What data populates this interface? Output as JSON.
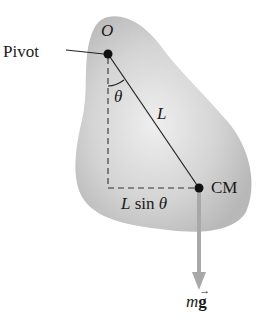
{
  "figure": {
    "labels": {
      "pivot": "Pivot",
      "origin": "O",
      "angle": "θ",
      "length": "L",
      "center_of_mass": "CM",
      "moment_arm_L": "L",
      "moment_arm_sin": "sin",
      "moment_arm_theta": "θ",
      "force_m": "m",
      "force_g": "g",
      "vector_arrow": "→"
    },
    "colors": {
      "body_fill": "#c8c8c8",
      "body_highlight": "#eeeeee",
      "line": "#222222",
      "force_arrow": "#a8a8a8",
      "dot": "#111111"
    },
    "geometry": {
      "pivot_point": [
        108,
        54
      ],
      "cm_point": [
        199,
        188
      ],
      "arrow_end": [
        199,
        290
      ]
    }
  }
}
